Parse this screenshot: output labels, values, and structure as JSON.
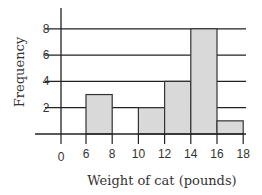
{
  "chart_data": {
    "type": "bar",
    "subtype": "histogram",
    "title": "",
    "xlabel": "Weight of cat (pounds)",
    "ylabel": "Frequency",
    "x_ticks": [
      0,
      6,
      8,
      10,
      12,
      14,
      16,
      18
    ],
    "y_ticks": [
      2,
      4,
      6,
      8
    ],
    "ylim": [
      0,
      8
    ],
    "grid": "horizontal",
    "axis_break": "between 0 and 6 on x-axis (0 shown at origin)",
    "bins": [
      {
        "range": [
          6,
          8
        ],
        "value": 3
      },
      {
        "range": [
          8,
          10
        ],
        "value": 0
      },
      {
        "range": [
          10,
          12
        ],
        "value": 2
      },
      {
        "range": [
          12,
          14
        ],
        "value": 4
      },
      {
        "range": [
          14,
          16
        ],
        "value": 8
      },
      {
        "range": [
          16,
          18
        ],
        "value": 1
      }
    ],
    "categories": [
      "6-8",
      "8-10",
      "10-12",
      "12-14",
      "14-16",
      "16-18"
    ],
    "values": [
      3,
      0,
      2,
      4,
      8,
      1
    ],
    "colors": {
      "bar_fill": "#d9d9d9",
      "bar_stroke": "#333333",
      "grid": "#222222",
      "axis": "#222222"
    }
  }
}
